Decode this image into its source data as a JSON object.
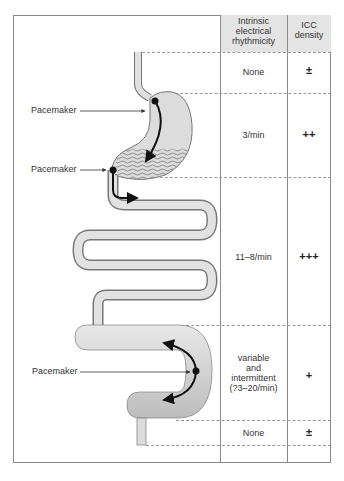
{
  "table": {
    "headers": {
      "rhythmicity": "Intrinsic electrical rhythmicity",
      "rhythmicity_lines": [
        "Intrinsic",
        "electrical",
        "rhythmicity"
      ],
      "icc": "ICC density",
      "icc_lines": [
        "ICC",
        "density"
      ]
    },
    "rows": [
      {
        "segment": "esophagus",
        "rhythmicity": "None",
        "icc_density": "±"
      },
      {
        "segment": "stomach",
        "rhythmicity": "3/min",
        "icc_density": "++"
      },
      {
        "segment": "small-intestine",
        "rhythmicity": "11–8/min",
        "icc_density": "+++"
      },
      {
        "segment": "colon",
        "rhythmicity_lines": [
          "variable",
          "and",
          "intermittent",
          "(?3–20/min)"
        ],
        "rhythmicity": "variable and intermittent (?3–20/min)",
        "icc_density": "+"
      },
      {
        "segment": "rectum",
        "rhythmicity": "None",
        "icc_density": "±"
      }
    ]
  },
  "labels": {
    "pacemaker_stomach_body": "Pacemaker",
    "pacemaker_pylorus": "Pacemaker",
    "pacemaker_colon": "Pacemaker"
  },
  "colors": {
    "organ_fill": "#d6d6d6",
    "organ_stroke": "#777777",
    "arrow": "#111111",
    "header_bg": "#e4e4e4"
  }
}
